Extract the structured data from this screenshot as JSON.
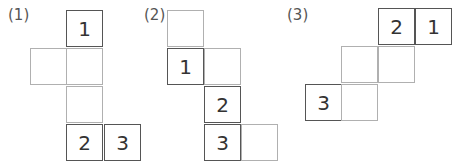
{
  "figures": [
    {
      "label": "(1)",
      "label_pos": [
        8,
        6
      ],
      "cells": [
        {
          "x": 66,
          "y": 10,
          "text": "1",
          "style": "bold"
        },
        {
          "x": 30,
          "y": 48,
          "text": "",
          "style": "thin"
        },
        {
          "x": 66,
          "y": 48,
          "text": "",
          "style": "thin"
        },
        {
          "x": 66,
          "y": 86,
          "text": "",
          "style": "thin"
        },
        {
          "x": 66,
          "y": 124,
          "text": "2",
          "style": "bold"
        },
        {
          "x": 104,
          "y": 124,
          "text": "3",
          "style": "bold"
        }
      ]
    },
    {
      "label": "(2)",
      "label_pos": [
        144,
        6
      ],
      "cells": [
        {
          "x": 167,
          "y": 10,
          "text": "",
          "style": "thin"
        },
        {
          "x": 167,
          "y": 48,
          "text": "1",
          "style": "bold"
        },
        {
          "x": 204,
          "y": 48,
          "text": "",
          "style": "thin"
        },
        {
          "x": 204,
          "y": 86,
          "text": "2",
          "style": "bold"
        },
        {
          "x": 204,
          "y": 124,
          "text": "3",
          "style": "bold"
        },
        {
          "x": 241,
          "y": 124,
          "text": "",
          "style": "thin"
        }
      ]
    },
    {
      "label": "(3)",
      "label_pos": [
        287,
        6
      ],
      "cells": [
        {
          "x": 378,
          "y": 8,
          "text": "2",
          "style": "bold"
        },
        {
          "x": 415,
          "y": 8,
          "text": "1",
          "style": "bold"
        },
        {
          "x": 341,
          "y": 46,
          "text": "",
          "style": "thin"
        },
        {
          "x": 378,
          "y": 46,
          "text": "",
          "style": "thin"
        },
        {
          "x": 305,
          "y": 84,
          "text": "3",
          "style": "bold"
        },
        {
          "x": 341,
          "y": 84,
          "text": "",
          "style": "thin"
        }
      ]
    }
  ]
}
